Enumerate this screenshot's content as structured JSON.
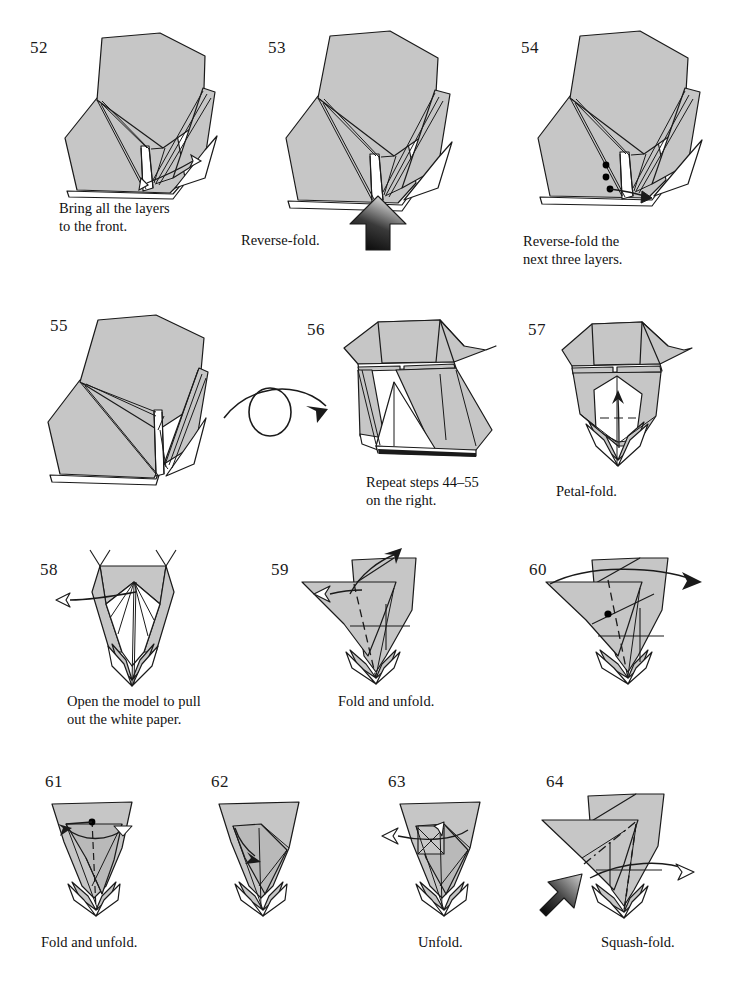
{
  "page": {
    "background_color": "#ffffff",
    "paper_fill": "#c6c6c6",
    "paper_fill_dark": "#b4b4b4",
    "paper_white": "#ffffff",
    "line_color": "#1a1a1a"
  },
  "symbols": {
    "turn_over": "turn-over-symbol",
    "push_arrow": "push-arrow",
    "fold_arrow": "fold-arrow",
    "unfold_arrow": "unfold-hollow-arrow",
    "valley_fold": "dashed-line",
    "mountain_fold": "dash-dot-line",
    "reference_point": "black-dot"
  },
  "steps": [
    {
      "number": "52",
      "caption": "Bring all the layers\nto the front.",
      "diagram": "layered-pentagon-front",
      "arrows": [
        "fold-arrow"
      ],
      "num_pos": {
        "x": 30,
        "y": 38
      },
      "cap_pos": {
        "x": 59,
        "y": 200
      }
    },
    {
      "number": "53",
      "caption": "Reverse-fold.",
      "diagram": "layered-pentagon-reverse",
      "arrows": [
        "push-arrow"
      ],
      "num_pos": {
        "x": 268,
        "y": 38
      },
      "cap_pos": {
        "x": 241,
        "y": 232
      }
    },
    {
      "number": "54",
      "caption": "Reverse-fold the\nnext three layers.",
      "diagram": "layered-pentagon-three-dots",
      "arrows": [
        "fold-arrow"
      ],
      "markers": [
        "black-dot",
        "black-dot",
        "black-dot"
      ],
      "num_pos": {
        "x": 521,
        "y": 38
      },
      "cap_pos": {
        "x": 523,
        "y": 233
      }
    },
    {
      "number": "55",
      "caption": "",
      "diagram": "layered-pentagon-flat",
      "arrows": [],
      "num_pos": {
        "x": 50,
        "y": 316
      },
      "cap_pos": {
        "x": 0,
        "y": 0
      }
    },
    {
      "number": "56",
      "caption": "Repeat steps 44–55\non the right.",
      "diagram": "turned-over-body",
      "arrows": [],
      "num_pos": {
        "x": 307,
        "y": 320
      },
      "cap_pos": {
        "x": 366,
        "y": 474
      }
    },
    {
      "number": "57",
      "caption": "Petal-fold.",
      "diagram": "petal-fold-body",
      "arrows": [
        "fold-arrow"
      ],
      "num_pos": {
        "x": 528,
        "y": 320
      },
      "cap_pos": {
        "x": 556,
        "y": 483
      }
    },
    {
      "number": "58",
      "caption": "Open the model to pull\nout the white paper.",
      "diagram": "inverted-triangle-open",
      "arrows": [
        "unfold-hollow-arrow"
      ],
      "num_pos": {
        "x": 40,
        "y": 560
      },
      "cap_pos": {
        "x": 67,
        "y": 693
      }
    },
    {
      "number": "59",
      "caption": "Fold and unfold.",
      "diagram": "triangle-fold-unfold",
      "arrows": [
        "fold-arrow",
        "unfold-hollow-arrow"
      ],
      "folds": [
        "dashed-line"
      ],
      "num_pos": {
        "x": 271,
        "y": 560
      },
      "cap_pos": {
        "x": 338,
        "y": 693
      }
    },
    {
      "number": "60",
      "caption": "",
      "diagram": "triangle-with-dot",
      "arrows": [
        "fold-arrow"
      ],
      "markers": [
        "black-dot"
      ],
      "num_pos": {
        "x": 529,
        "y": 560
      },
      "cap_pos": {
        "x": 0,
        "y": 0
      }
    },
    {
      "number": "61",
      "caption": "Fold and unfold.",
      "diagram": "narrow-cone-fold",
      "arrows": [
        "fold-arrow"
      ],
      "markers": [
        "black-dot"
      ],
      "num_pos": {
        "x": 45,
        "y": 772
      },
      "cap_pos": {
        "x": 41,
        "y": 934
      }
    },
    {
      "number": "62",
      "caption": "",
      "diagram": "narrow-cone-folded",
      "arrows": [
        "fold-arrow"
      ],
      "num_pos": {
        "x": 211,
        "y": 772
      },
      "cap_pos": {
        "x": 0,
        "y": 0
      }
    },
    {
      "number": "63",
      "caption": "Unfold.",
      "diagram": "narrow-cone-unfold",
      "arrows": [
        "unfold-hollow-arrow"
      ],
      "num_pos": {
        "x": 388,
        "y": 772
      },
      "cap_pos": {
        "x": 418,
        "y": 934
      }
    },
    {
      "number": "64",
      "caption": "Squash-fold.",
      "diagram": "triangle-squash",
      "arrows": [
        "push-arrow",
        "fold-arrow"
      ],
      "folds": [
        "dashed-line",
        "dash-dot-line"
      ],
      "num_pos": {
        "x": 546,
        "y": 772
      },
      "cap_pos": {
        "x": 601,
        "y": 934
      }
    }
  ]
}
